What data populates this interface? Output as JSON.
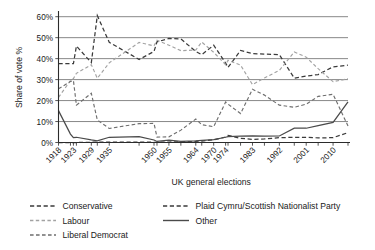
{
  "chart_data": {
    "type": "line",
    "title": "",
    "xlabel": "UK general elections",
    "ylabel": "Share of vote %",
    "ylim": [
      0,
      62
    ],
    "yticks": [
      0,
      10,
      20,
      30,
      40,
      50,
      60
    ],
    "ytick_labels": [
      "0%",
      "10%",
      "20%",
      "30%",
      "40%",
      "50%",
      "60%"
    ],
    "grid": true,
    "legend_position": "bottom",
    "x": [
      1918,
      1922,
      1923,
      1924,
      1929,
      1931,
      1935,
      1945,
      1950,
      1951,
      1955,
      1959,
      1964,
      1966,
      1970,
      1974,
      1974.8,
      1979,
      1983,
      1987,
      1992,
      1997,
      2001,
      2005,
      2010,
      2015
    ],
    "xtick_labels": [
      "1918",
      "1923",
      "1929",
      "1935",
      "1950",
      "1955",
      "1964",
      "1970",
      "1974",
      "1983",
      "1992",
      "2001",
      "2010"
    ],
    "xtick_values": [
      1918,
      1923,
      1929,
      1935,
      1950,
      1955,
      1964,
      1970,
      1974,
      1983,
      1992,
      2001,
      2010
    ],
    "series": [
      {
        "name": "Conservative",
        "style": "dashed-dark",
        "color": "#3a3a3a",
        "values": [
          37.6,
          37.6,
          37.6,
          46.0,
          38.1,
          60.5,
          47.8,
          39.6,
          43.4,
          48.0,
          49.6,
          49.4,
          43.4,
          41.9,
          46.4,
          37.9,
          35.8,
          43.9,
          42.4,
          42.2,
          41.9,
          30.7,
          31.7,
          32.4,
          36.1,
          36.9
        ]
      },
      {
        "name": "Labour",
        "style": "dashed-light",
        "color": "#9a9a9a",
        "values": [
          21.5,
          29.5,
          30.5,
          33.0,
          37.1,
          30.6,
          38.0,
          47.7,
          46.1,
          48.8,
          46.4,
          43.8,
          44.1,
          47.9,
          43.0,
          37.1,
          39.2,
          36.9,
          27.6,
          30.8,
          34.4,
          43.2,
          40.7,
          35.2,
          29.0,
          30.4
        ]
      },
      {
        "name": "Liberal Democrat",
        "style": "dashed-medium",
        "color": "#6b6b6b",
        "values": [
          25.6,
          29.1,
          29.6,
          17.8,
          23.5,
          10.7,
          6.7,
          9.0,
          9.1,
          2.6,
          2.7,
          5.9,
          11.2,
          8.5,
          7.5,
          19.3,
          18.3,
          13.8,
          25.4,
          22.6,
          17.8,
          16.8,
          18.3,
          22.0,
          23.0,
          7.9
        ]
      },
      {
        "name": "Plaid Cymru/Scottish Nationalist Party",
        "style": "dashed-dark",
        "color": "#2b2b2b",
        "values": [
          0.0,
          0.0,
          0.0,
          0.0,
          0.1,
          0.2,
          0.2,
          0.2,
          0.1,
          0.1,
          0.2,
          0.4,
          0.5,
          0.7,
          1.3,
          2.6,
          3.4,
          2.0,
          1.5,
          1.7,
          2.3,
          2.5,
          2.5,
          2.2,
          2.3,
          4.7
        ]
      },
      {
        "name": "Other",
        "style": "solid",
        "color": "#4a4a4a",
        "values": [
          15.2,
          4.0,
          2.3,
          2.5,
          1.2,
          0.8,
          2.5,
          2.8,
          1.2,
          0.5,
          1.1,
          0.5,
          0.8,
          1.0,
          1.4,
          2.5,
          2.8,
          3.0,
          3.1,
          3.0,
          3.1,
          6.8,
          6.8,
          8.0,
          9.6,
          19.4
        ]
      }
    ]
  },
  "legend": {
    "entries": [
      {
        "label": "Conservative",
        "style": "dashed-dark"
      },
      {
        "label": "Labour",
        "style": "dashed-light"
      },
      {
        "label": "Liberal Democrat",
        "style": "dashed-medium"
      },
      {
        "label": "Plaid Cymru/Scottish Nationalist Party",
        "style": "dashed-dark"
      },
      {
        "label": "Other",
        "style": "solid"
      }
    ]
  }
}
